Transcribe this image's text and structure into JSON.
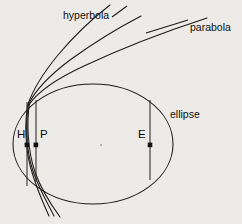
{
  "figure": {
    "background_color": "#edebe7",
    "stroke_color": "#1b1b1b",
    "labels": {
      "hyperbola": "hyperbola",
      "parabola": "parabola",
      "ellipse": "ellipse",
      "point_h": "H",
      "point_p": "P",
      "point_e": "E"
    },
    "curves": [
      {
        "name": "hyperbola",
        "label": "hyperbola"
      },
      {
        "name": "parabola",
        "label": "parabola"
      },
      {
        "name": "ellipse",
        "label": "ellipse"
      }
    ],
    "points": [
      {
        "name": "H",
        "label": "H",
        "x": 27,
        "y": 145
      },
      {
        "name": "P",
        "label": "P",
        "x": 36,
        "y": 145
      },
      {
        "name": "E",
        "label": "E",
        "x": 150,
        "y": 145
      }
    ],
    "latus_rectum_chords": [
      {
        "name": "hyperbola-chord",
        "x": 27,
        "y_top": 102,
        "y_bottom": 186
      },
      {
        "name": "parabola-chord",
        "x": 36,
        "y_top": 100,
        "y_bottom": 182
      },
      {
        "name": "ellipse-chord",
        "x": 150,
        "y_top": 100,
        "y_bottom": 180
      }
    ],
    "ellipse_geometry": {
      "center_x": 93,
      "center_y": 144,
      "radius_x": 80,
      "radius_y": 60
    }
  }
}
